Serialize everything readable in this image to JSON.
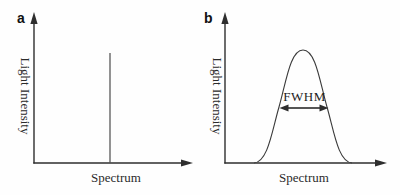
{
  "figure": {
    "background_color": "#fefefe",
    "ink_color": "#2e2e2e",
    "panels": [
      {
        "label": "a",
        "y_axis_label": "Light Intensity",
        "x_axis_label": "Spectrum",
        "curve_type": "narrow-spectral-line"
      },
      {
        "label": "b",
        "y_axis_label": "Light Intensity",
        "x_axis_label": "Spectrum",
        "curve_type": "broad-band-bell-curve",
        "annotation": "FWHM"
      }
    ]
  }
}
